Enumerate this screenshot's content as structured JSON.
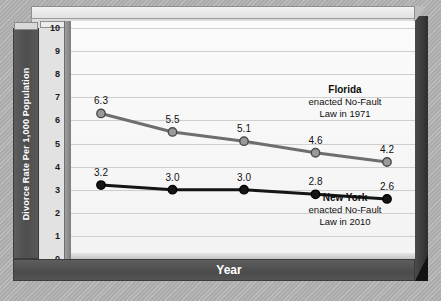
{
  "chart_data": {
    "type": "line",
    "title": "",
    "xlabel": "Year",
    "ylabel": "Divorce Rate Per 1,000 Population",
    "categories": [
      "1990",
      "1995",
      "2000",
      "2005",
      "2009"
    ],
    "x": [
      1990,
      1995,
      2000,
      2005,
      2009
    ],
    "ylim": [
      0,
      10
    ],
    "yticks": [
      "0",
      "1",
      "2",
      "3",
      "4",
      "5",
      "6",
      "7",
      "8",
      "9",
      "10"
    ],
    "grid": true,
    "legend_position": "inline-annotation",
    "series": [
      {
        "name": "Florida",
        "color": "#6e6e6e",
        "marker_fill": "#9a9a9a",
        "values": [
          6.3,
          5.5,
          5.1,
          4.6,
          4.2
        ],
        "labels": [
          "6.3",
          "5.5",
          "5.1",
          "4.6",
          "4.2"
        ]
      },
      {
        "name": "New York",
        "color": "#151515",
        "marker_fill": "#151515",
        "values": [
          3.2,
          3.0,
          3.0,
          2.8,
          2.6
        ],
        "labels": [
          "3.2",
          "3.0",
          "3.0",
          "2.8",
          "2.6"
        ]
      }
    ],
    "annotations": [
      {
        "name": "Florida",
        "line1": "enacted No-Fault",
        "line2": "Law in 1971"
      },
      {
        "name": "New York",
        "line1": "enacted No-Fault",
        "line2": "Law in 2010"
      }
    ]
  },
  "colors": {
    "florida_line": "#6e6e6e",
    "newyork_line": "#151515",
    "axis_bar": "#4e4e4e",
    "plot_bg": "#fbfbfb",
    "canvas_bg": "#b2b2b2"
  }
}
